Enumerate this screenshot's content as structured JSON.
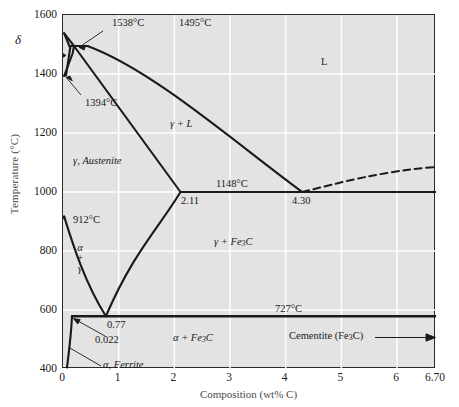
{
  "chart_data": {
    "type": "line",
    "title": "",
    "xlabel": "Composition (wt% C)",
    "ylabel": "Temperature (°C)",
    "xlim": [
      0,
      6.7
    ],
    "ylim": [
      400,
      1600
    ],
    "grid": true,
    "legend": "none",
    "xticks": [
      "0",
      "1",
      "2",
      "3",
      "4",
      "5",
      "6",
      "6.70"
    ],
    "xtick_values": [
      0,
      1,
      2,
      3,
      4,
      5,
      6,
      6.7
    ],
    "yticks": [
      "400",
      "600",
      "800",
      "1000",
      "1200",
      "1400",
      "1600"
    ],
    "ytick_values": [
      400,
      600,
      800,
      1000,
      1200,
      1400,
      1600
    ],
    "invariant_points": [
      {
        "name": "melting-point-iron",
        "label": "1538°C",
        "c": 0.0,
        "t": 1538
      },
      {
        "name": "peritectic",
        "label": "1495°C",
        "c": 0.17,
        "t": 1495
      },
      {
        "name": "delta-to-gamma",
        "label": "1394°C",
        "c": 0.0,
        "t": 1394
      },
      {
        "name": "eutectic",
        "label": "1148°C",
        "c": 4.3,
        "t": 1148
      },
      {
        "name": "gamma-max-solubility",
        "label": "2.11",
        "c": 2.11,
        "t": 1148
      },
      {
        "name": "eutectic-composition",
        "label": "4.30",
        "c": 4.3,
        "t": 1148
      },
      {
        "name": "alpha-to-gamma",
        "label": "912°C",
        "c": 0.0,
        "t": 912
      },
      {
        "name": "eutectoid",
        "label": "727°C",
        "c": 0.77,
        "t": 727
      },
      {
        "name": "eutectoid-composition",
        "label": "0.77",
        "c": 0.77,
        "t": 727
      },
      {
        "name": "alpha-max-solubility",
        "label": "0.022",
        "c": 0.022,
        "t": 727
      }
    ],
    "phase_regions": [
      {
        "name": "liquid",
        "label": "L",
        "c": 4.55,
        "t": 1490
      },
      {
        "name": "gamma-plus-liquid",
        "label": "γ + L",
        "c": 1.85,
        "t": 1325
      },
      {
        "name": "gamma-austenite",
        "label": "γ, Austenite",
        "c": 0.7,
        "t": 1025
      },
      {
        "name": "gamma-plus-cementite",
        "label": "γ + Fe3C",
        "c": 3.05,
        "t": 935
      },
      {
        "name": "alpha-plus-cementite",
        "label": "α + Fe3C",
        "c": 2.3,
        "t": 620
      },
      {
        "name": "alpha-ferrite",
        "label": "α, Ferrite",
        "c": 0.6,
        "t": 612
      },
      {
        "name": "alpha-plus-gamma",
        "label": "α + γ",
        "c": 0.13,
        "t": 820
      },
      {
        "name": "delta-ferrite",
        "label": "δ",
        "c": 0.0,
        "t": 1480
      }
    ],
    "callouts": [
      {
        "name": "cementite-callout",
        "label": "Cementite (Fe3C)",
        "c": 6.7,
        "t": 530
      }
    ],
    "liquidus_dashed_right_end": {
      "c": 6.7,
      "t": 1227
    }
  },
  "labels": {
    "L": "L",
    "gamma_plus_L": "γ + L",
    "gamma_austenite": "γ, Austenite",
    "alpha_ferrite": "α, Ferrite",
    "delta": "δ",
    "t1538": "1538°C",
    "t1495": "1495°C",
    "t1394": "1394°C",
    "t1148": "1148°C",
    "t912": "912°C",
    "t727": "727°C",
    "c211": "2.11",
    "c430": "4.30",
    "c077": "0.77",
    "c0022": "0.022",
    "gamma_fe3c_pre": "γ + Fe",
    "gamma_fe3c_sub": "3",
    "gamma_fe3c_post": "C",
    "alpha_fe3c_pre": "α + Fe",
    "alpha_fe3c_sub": "3",
    "alpha_fe3c_post": "C",
    "cementite_pre": "Cementite (Fe",
    "cementite_sub": "3",
    "cementite_post": "C)",
    "alpha_stack_a": "α",
    "alpha_stack_plus": "+",
    "alpha_stack_g": "γ"
  },
  "axes": {
    "x_title": "Composition (wt% C)",
    "y_title": "Temperature (°C)"
  },
  "colors": {
    "plot_background": "#e3e3e3",
    "gridline": "#ffffff",
    "curve": "#1a1a1a",
    "frame": "#2b2b2b",
    "text": "#1a1a1a"
  }
}
